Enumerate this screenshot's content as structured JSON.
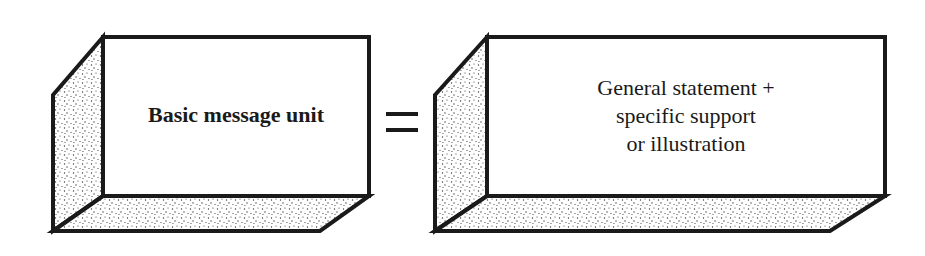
{
  "diagram": {
    "type": "equation-of-blocks",
    "left_block": {
      "label": "Basic message unit",
      "style": "bold"
    },
    "operator": "=",
    "right_block": {
      "lines": [
        "General statement +",
        "specific support",
        "or illustration"
      ],
      "style": "regular"
    },
    "colors": {
      "ink": "#1a1a1a",
      "face": "#ffffff",
      "stipple_dots": "#3a3a3a"
    }
  }
}
